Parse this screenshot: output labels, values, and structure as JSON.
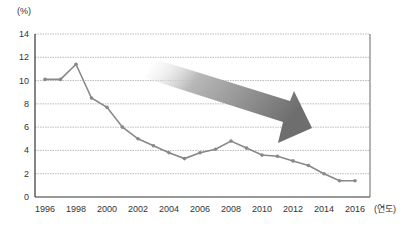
{
  "chart_data": {
    "type": "line",
    "title": "",
    "ylabel": "(%)",
    "xlabel": "(연도)",
    "ylim": [
      0,
      14
    ],
    "yticks": [
      0,
      2,
      4,
      6,
      8,
      10,
      12,
      14
    ],
    "xticks": [
      1996,
      1998,
      2000,
      2002,
      2004,
      2006,
      2008,
      2010,
      2012,
      2014,
      2016
    ],
    "grid": true,
    "legend": null,
    "annotations": [
      "Large downward-trend arrow (gradient gray)"
    ],
    "x": [
      1996,
      1997,
      1998,
      1999,
      2000,
      2001,
      2002,
      2003,
      2004,
      2005,
      2006,
      2007,
      2008,
      2009,
      2010,
      2011,
      2012,
      2013,
      2014,
      2015,
      2016
    ],
    "series": [
      {
        "name": "rate",
        "color": "#888888",
        "values": [
          10.1,
          10.1,
          11.4,
          8.5,
          7.7,
          6.0,
          5.0,
          4.4,
          3.8,
          3.3,
          3.8,
          4.1,
          4.8,
          4.2,
          3.6,
          3.5,
          3.1,
          2.7,
          2.0,
          1.4,
          1.4
        ]
      }
    ]
  }
}
